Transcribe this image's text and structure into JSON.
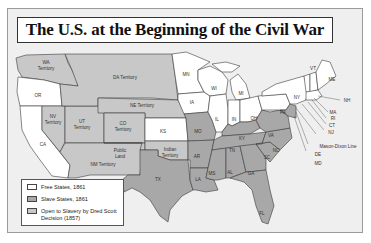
{
  "title": "The U.S. at the Beginning of the Civil War",
  "colors": {
    "free": "#ffffff",
    "slave": "#a8a8a8",
    "open": "#c8c8c8",
    "background": "#efefef",
    "border": "#3a3a3a"
  },
  "labels": {
    "wa": "WA",
    "wa2": "Territory",
    "or": "OR",
    "ca": "CA",
    "nv": "NV",
    "nv2": "Territory",
    "ut": "UT",
    "ut2": "Territory",
    "co": "CO",
    "co2": "Territory",
    "da": "DA Territory",
    "ne": "NE Territory",
    "ks": "KS",
    "public1": "Public",
    "public2": "Land",
    "nm": "NM Territory",
    "indian1": "Indian",
    "indian2": "Territory",
    "tx": "TX",
    "mn": "MN",
    "ia": "IA",
    "mo": "MO",
    "ar": "AR",
    "la": "LA",
    "wi": "WI",
    "il": "IL",
    "mi": "MI",
    "in": "IN",
    "oh": "OH",
    "ky": "KY",
    "tn": "TN",
    "ms": "MS",
    "al": "AL",
    "ga": "GA",
    "fl": "FL",
    "sc": "SC",
    "nc": "NC",
    "va": "VA",
    "pa": "PA",
    "ny": "NY",
    "vt": "VT",
    "me": "ME",
    "nh": "NH",
    "ma": "MA",
    "ri": "RI",
    "ct": "CT",
    "nj": "NJ",
    "mason": "Mason-Dixon Line",
    "de": "DE",
    "md": "MD"
  },
  "legend": [
    {
      "label": "Free States, 1861",
      "color": "#ffffff"
    },
    {
      "label": "Slave States, 1861",
      "color": "#a8a8a8"
    },
    {
      "label": "Open to Slavery by Dred Scott Decision (1857)",
      "color": "#c8c8c8"
    }
  ]
}
